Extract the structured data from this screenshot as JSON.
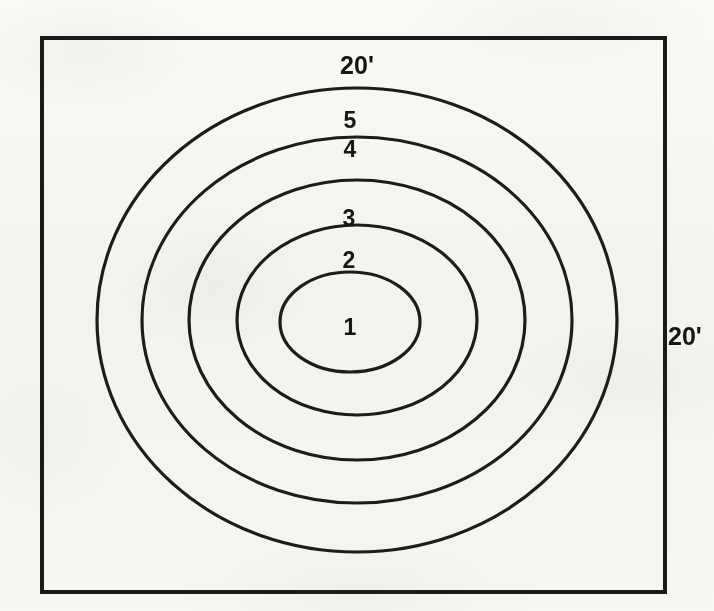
{
  "figure": {
    "background_color": "#fbfbf9",
    "ink_color": "#1a1a1a",
    "frame": {
      "name": "plot-border",
      "x": 42,
      "y": 38,
      "width": 623,
      "height": 554,
      "stroke_width": 4,
      "shown": true
    },
    "dimension_labels": [
      {
        "id": "top",
        "text": "20'",
        "x": 357,
        "y": 74,
        "anchor": "middle"
      },
      {
        "id": "right",
        "text": "20'",
        "x": 668,
        "y": 345,
        "anchor": "start"
      }
    ]
  },
  "chart_data": {
    "type": "scatter",
    "subtitle": "",
    "xlabel": "20'",
    "ylabel": "20'",
    "grid": false,
    "legend_position": "none",
    "units": "feet",
    "plot_extent": {
      "width": "20'",
      "height": "20'"
    },
    "center": {
      "cx": 357,
      "cy": 320
    },
    "rings": [
      {
        "label": "1",
        "index": 1,
        "rx": 70,
        "ry": 50,
        "label_x": 350,
        "label_y": 335
      },
      {
        "label": "2",
        "index": 2,
        "rx": 120,
        "ry": 95,
        "label_x": 349,
        "label_y": 268
      },
      {
        "label": "3",
        "index": 3,
        "rx": 168,
        "ry": 140,
        "label_x": 349,
        "label_y": 226
      },
      {
        "label": "4",
        "index": 4,
        "rx": 215,
        "ry": 183,
        "label_x": 350,
        "label_y": 157
      },
      {
        "label": "5",
        "index": 5,
        "rx": 260,
        "ry": 232,
        "label_x": 350,
        "label_y": 128
      }
    ],
    "ring_labels": [
      "1",
      "2",
      "3",
      "4",
      "5"
    ],
    "ring_radii_x": [
      70,
      120,
      168,
      215,
      260
    ],
    "ring_radii_y": [
      50,
      95,
      140,
      183,
      232
    ],
    "annotations": [
      "20'",
      "20'",
      "5",
      "4",
      "3",
      "2",
      "1"
    ]
  }
}
